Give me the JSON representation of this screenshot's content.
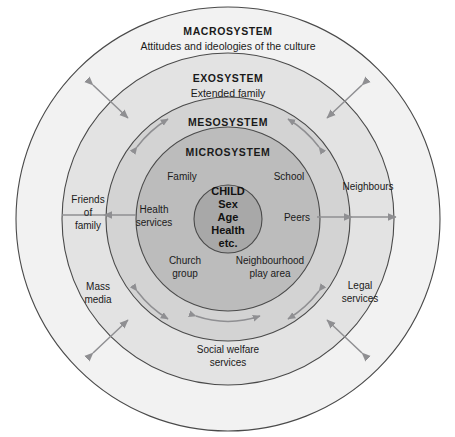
{
  "diagram": {
    "background_color": "#ffffff",
    "outline_color": "#4a4a4a",
    "arrow_color": "#8f8f92",
    "text_color": "#1a1a1a"
  },
  "rings": [
    {
      "id": "macrosystem",
      "title": "MACROSYSTEM",
      "subtitle": "Attitudes and ideologies of the culture",
      "fill": "#f2f2f2",
      "radius": 212
    },
    {
      "id": "exosystem",
      "title": "EXOSYSTEM",
      "subtitle": "Extended family",
      "fill": "#e3e3e3",
      "radius": 166
    },
    {
      "id": "mesosystem",
      "title": "MESOSYSTEM",
      "subtitle": "",
      "fill": "#d3d3d3",
      "radius": 122
    },
    {
      "id": "microsystem",
      "title": "MICROSYSTEM",
      "subtitle": "",
      "fill": "#bcbcbc",
      "radius": 92
    }
  ],
  "core": {
    "id": "child-core",
    "fill": "#a8a8a8",
    "radius": 34,
    "lines": [
      "CHILD",
      "Sex",
      "Age",
      "Health",
      "etc."
    ]
  },
  "microsystem_nodes": [
    {
      "id": "family",
      "lines": [
        "Family"
      ],
      "x": 182,
      "y": 176
    },
    {
      "id": "school",
      "lines": [
        "School"
      ],
      "x": 289,
      "y": 176
    },
    {
      "id": "health-services",
      "lines": [
        "Health",
        "services"
      ],
      "x": 150,
      "y": 213
    },
    {
      "id": "peers",
      "lines": [
        "Peers"
      ],
      "x": 300,
      "y": 218
    },
    {
      "id": "church-group",
      "lines": [
        "Church",
        "group"
      ],
      "x": 178,
      "y": 262
    },
    {
      "id": "neighbourhood-play-area",
      "lines": [
        "Neighbourhood",
        "play area"
      ],
      "x": 268,
      "y": 262
    }
  ],
  "outer_nodes": [
    {
      "id": "friends-of-family",
      "lines": [
        "Friends",
        "of",
        "family"
      ],
      "x": 88,
      "y": 205
    },
    {
      "id": "neighbours",
      "lines": [
        "Neighbours"
      ],
      "x": 367,
      "y": 187
    },
    {
      "id": "mass-media",
      "lines": [
        "Mass",
        "media"
      ],
      "x": 96,
      "y": 288
    },
    {
      "id": "legal-services",
      "lines": [
        "Legal",
        "services"
      ],
      "x": 360,
      "y": 287
    },
    {
      "id": "social-welfare-services",
      "lines": [
        "Social welfare",
        "services"
      ],
      "x": 228,
      "y": 351
    }
  ]
}
